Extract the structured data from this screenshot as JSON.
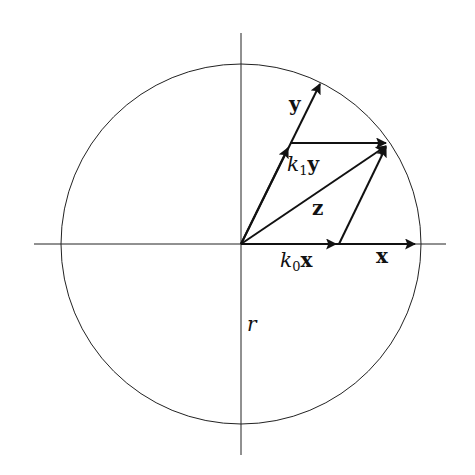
{
  "diagram": {
    "title": "",
    "circle": {
      "center": [
        241,
        244
      ],
      "radius": 180
    },
    "axes": {
      "horizontal": {
        "from": [
          34,
          244
        ],
        "to": [
          446,
          244
        ]
      },
      "vertical": {
        "from": [
          241,
          33
        ],
        "to": [
          241,
          455
        ]
      }
    },
    "vectors": [
      {
        "name": "x",
        "from": [
          241,
          244
        ],
        "to": [
          416,
          244
        ]
      },
      {
        "name": "k0x",
        "from": [
          241,
          244
        ],
        "to": [
          339,
          244
        ]
      },
      {
        "name": "y",
        "from": [
          241,
          244
        ],
        "to": [
          320,
          84
        ]
      },
      {
        "name": "k1y",
        "from": [
          241,
          244
        ],
        "to": [
          290,
          143
        ]
      },
      {
        "name": "z",
        "from": [
          241,
          244
        ],
        "to": [
          387,
          145
        ]
      },
      {
        "name": "k1y-to-z",
        "from": [
          290,
          143
        ],
        "to": [
          387,
          143
        ]
      },
      {
        "name": "k0x-to-z",
        "from": [
          339,
          244
        ],
        "to": [
          387,
          145
        ]
      }
    ],
    "labels": {
      "y": "y",
      "k1y_coef": "k",
      "k1y_sub": "1",
      "k1y_vec": "y",
      "z": "z",
      "k0x_coef": "k",
      "k0x_sub": "0",
      "k0x_vec": "x",
      "x": "x",
      "r": "r"
    },
    "colors": {
      "stroke": "#111111",
      "background": "#ffffff"
    }
  }
}
